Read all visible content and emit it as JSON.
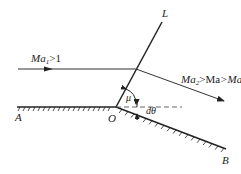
{
  "diagram": {
    "type": "Prandtl-Meyer expansion fan (single Mach wave)",
    "labels": {
      "upstream_flow": "Ma",
      "upstream_flow_sub": "1",
      "upstream_flow_cond": ">1",
      "downstream_flow": "Ma",
      "downstream_flow_sub": "2",
      "downstream_flow_cmp": ">Ma",
      "downstream_flow_cmp_sub": "1",
      "mach_line": "L",
      "wall_start": "A",
      "corner": "O",
      "wall_end": "B",
      "mach_angle": "μ",
      "deflection_angle": "dθ"
    },
    "colors": {
      "line": "#222222",
      "dashed": "#555555",
      "background": "#ffffff"
    }
  }
}
